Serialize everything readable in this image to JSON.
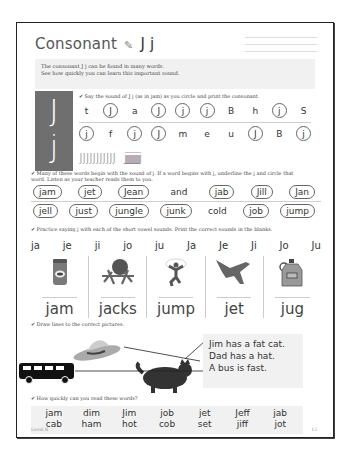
{
  "header": {
    "title": "Consonant",
    "pencil_icon": "pencil-icon",
    "letters": "J j"
  },
  "intro": {
    "line1": "The consonant J j can be found in many words.",
    "line2": "See how quickly you can learn this important sound."
  },
  "big_letters": {
    "upper": "J",
    "lower": "j"
  },
  "section1": {
    "instruction": "✔ Say the sound of J j (as in jam) as you circle and print the consonant.",
    "row1": [
      {
        "t": "t",
        "c": false
      },
      {
        "t": "J",
        "c": true
      },
      {
        "t": "a",
        "c": false
      },
      {
        "t": "J",
        "c": true
      },
      {
        "t": "j",
        "c": true
      },
      {
        "t": "j",
        "c": true
      },
      {
        "t": "B",
        "c": false
      },
      {
        "t": "h",
        "c": false
      },
      {
        "t": "j",
        "c": true
      },
      {
        "t": "S",
        "c": false
      }
    ],
    "row2": [
      {
        "t": "j",
        "c": true
      },
      {
        "t": "f",
        "c": false
      },
      {
        "t": "j",
        "c": true
      },
      {
        "t": "J",
        "c": true
      },
      {
        "t": "m",
        "c": false
      },
      {
        "t": "e",
        "c": false
      },
      {
        "t": "u",
        "c": false
      },
      {
        "t": "J",
        "c": true
      },
      {
        "t": "B",
        "c": false
      },
      {
        "t": "j",
        "c": true
      }
    ],
    "trace_upper": "JJJJJJJJJJJ",
    "trace_lower": "jjjjjjjjjjjjjjjj"
  },
  "section2": {
    "instruction_line1": "✔ Many of these words begin with the sound of j. If a word begins with j, underline the j and circle that",
    "instruction_line2": "word. Listen as your teacher reads them to you.",
    "row1": [
      {
        "t": "jam",
        "c": true
      },
      {
        "t": "jet",
        "c": true
      },
      {
        "t": "Jean",
        "c": true
      },
      {
        "t": "and",
        "c": false
      },
      {
        "t": "jab",
        "c": true
      },
      {
        "t": "Jill",
        "c": true
      },
      {
        "t": "Jan",
        "c": true
      }
    ],
    "row2": [
      {
        "t": "jell",
        "c": true
      },
      {
        "t": "just",
        "c": true
      },
      {
        "t": "jungle",
        "c": true
      },
      {
        "t": "junk",
        "c": true
      },
      {
        "t": "cold",
        "c": false
      },
      {
        "t": "job",
        "c": true
      },
      {
        "t": "jump",
        "c": true
      }
    ]
  },
  "section3": {
    "instruction": "✔ Practice saying j with each of the short vowel sounds. Print the correct sounds in the blanks.",
    "sounds": [
      "ja",
      "je",
      "ji",
      "jo",
      "ju",
      "Ja",
      "Je",
      "Ji",
      "Jo",
      "Ju"
    ],
    "pictures": [
      {
        "label": "jam",
        "icon": "jam-jar-icon"
      },
      {
        "label": "jacks",
        "icon": "jacks-icon"
      },
      {
        "label": "jump",
        "icon": "jumping-boy-icon"
      },
      {
        "label": "jet",
        "icon": "jet-plane-icon"
      },
      {
        "label": "jug",
        "icon": "jug-icon"
      }
    ]
  },
  "section4": {
    "instruction": "✔ Draw lines to the correct pictures.",
    "sentences": [
      "Jim has a fat cat.",
      "Dad has a hat.",
      "A bus is fast."
    ],
    "pictures": [
      "hat-icon",
      "bus-icon",
      "cat-icon"
    ]
  },
  "section5": {
    "instruction": "✔ How quickly can you read these words?",
    "row1": [
      "jam",
      "dim",
      "Jim",
      "job",
      "jet",
      "Jeff",
      "jab"
    ],
    "row2": [
      "cab",
      "ham",
      "hot",
      "cob",
      "set",
      "jiff",
      "jot"
    ]
  },
  "footer": {
    "level": "Level B",
    "page": "15"
  }
}
